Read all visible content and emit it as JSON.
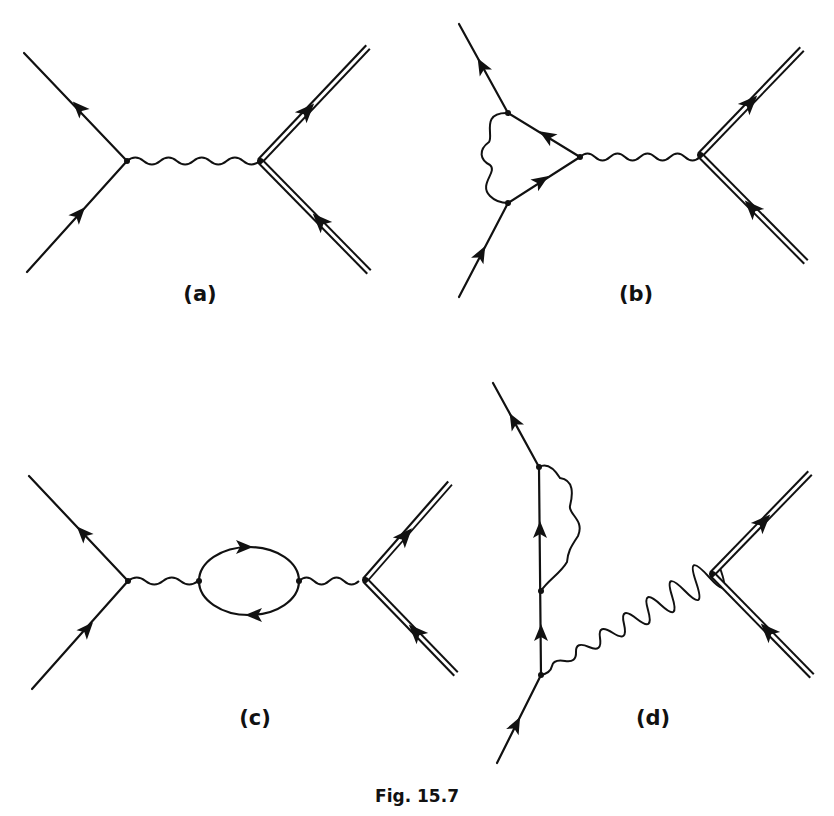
{
  "figure": {
    "caption": "Fig. 15.7",
    "panels": [
      {
        "id": "a",
        "label": "(a)",
        "description": "Tree-level exchange: fermion line vertex connected by wavy photon line to double-line (heavy particle) vertex"
      },
      {
        "id": "b",
        "label": "(b)",
        "description": "Vertex correction: triangle loop with internal wavy photon on the left fermion vertex"
      },
      {
        "id": "c",
        "label": "(c)",
        "description": "Vacuum polarization: closed fermion loop inserted in the photon propagator"
      },
      {
        "id": "d",
        "label": "(d)",
        "description": "Self-energy insertion on the outgoing fermion leg, photon attached at lower vertex"
      }
    ]
  },
  "colors": {
    "ink": "#111111",
    "paper": "#ffffff"
  }
}
